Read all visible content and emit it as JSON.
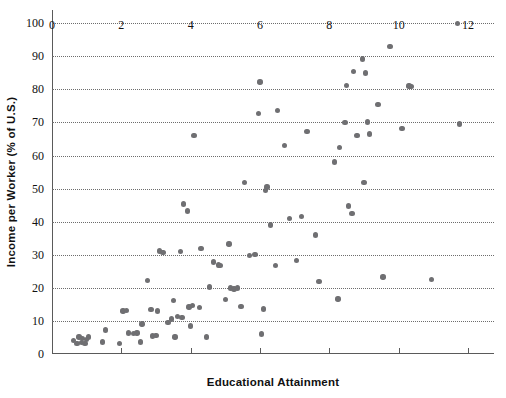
{
  "chart_data": {
    "type": "scatter",
    "title": "",
    "xlabel": "Educational Attainment",
    "ylabel": "Income per Worker (% of U.S.)",
    "xlim": [
      0,
      12.75
    ],
    "ylim": [
      0,
      104
    ],
    "xticks": [
      0,
      2,
      4,
      6,
      8,
      10,
      12
    ],
    "xtick_labels": [
      "0",
      "2",
      "4",
      "6",
      "8",
      "10",
      "12"
    ],
    "yticks": [
      0,
      10,
      20,
      30,
      40,
      50,
      60,
      70,
      80,
      90,
      100
    ],
    "ytick_labels": [
      "0",
      "10",
      "20",
      "30",
      "40",
      "50",
      "60",
      "70",
      "80",
      "90",
      "100"
    ],
    "grid": "horizontal-dotted",
    "legend": "none",
    "marker_color": "#6f6f72",
    "axis_color": "#5a5a5a",
    "points": [
      [
        0.62,
        4.0
      ],
      [
        0.72,
        3.1
      ],
      [
        0.78,
        5.2
      ],
      [
        0.85,
        3.4
      ],
      [
        0.88,
        4.6
      ],
      [
        0.95,
        3.2
      ],
      [
        1.0,
        4.4
      ],
      [
        1.05,
        5.1
      ],
      [
        1.45,
        3.6
      ],
      [
        1.55,
        7.2
      ],
      [
        1.95,
        3.1
      ],
      [
        2.05,
        13.0
      ],
      [
        2.15,
        13.1
      ],
      [
        2.2,
        6.3
      ],
      [
        2.35,
        6.2
      ],
      [
        2.45,
        6.3
      ],
      [
        2.55,
        3.6
      ],
      [
        2.6,
        9.1
      ],
      [
        2.75,
        22.3
      ],
      [
        2.85,
        13.4
      ],
      [
        2.9,
        5.4
      ],
      [
        3.0,
        5.6
      ],
      [
        3.05,
        13.0
      ],
      [
        3.1,
        31.1
      ],
      [
        3.2,
        30.7
      ],
      [
        3.35,
        9.6
      ],
      [
        3.45,
        10.6
      ],
      [
        3.5,
        16.2
      ],
      [
        3.55,
        5.1
      ],
      [
        3.62,
        11.4
      ],
      [
        3.7,
        30.9
      ],
      [
        3.75,
        11.1
      ],
      [
        3.8,
        45.4
      ],
      [
        3.9,
        43.2
      ],
      [
        3.95,
        14.2
      ],
      [
        4.0,
        8.5
      ],
      [
        4.05,
        14.6
      ],
      [
        4.1,
        66.0
      ],
      [
        4.25,
        14.0
      ],
      [
        4.3,
        31.9
      ],
      [
        4.45,
        5.1
      ],
      [
        4.55,
        20.2
      ],
      [
        4.65,
        27.8
      ],
      [
        4.8,
        26.9
      ],
      [
        4.85,
        26.8
      ],
      [
        5.0,
        16.4
      ],
      [
        5.1,
        33.2
      ],
      [
        5.15,
        20.0
      ],
      [
        5.25,
        19.7
      ],
      [
        5.35,
        20.0
      ],
      [
        5.45,
        14.3
      ],
      [
        5.55,
        51.8
      ],
      [
        5.7,
        29.8
      ],
      [
        5.85,
        30.0
      ],
      [
        5.95,
        72.8
      ],
      [
        6.0,
        82.2
      ],
      [
        6.05,
        6.0
      ],
      [
        6.1,
        13.6
      ],
      [
        6.15,
        49.5
      ],
      [
        6.2,
        50.5
      ],
      [
        6.3,
        39.0
      ],
      [
        6.45,
        26.8
      ],
      [
        6.5,
        73.6
      ],
      [
        6.7,
        63.0
      ],
      [
        6.85,
        41.0
      ],
      [
        7.05,
        28.2
      ],
      [
        7.2,
        41.6
      ],
      [
        7.35,
        67.3
      ],
      [
        7.6,
        36.0
      ],
      [
        7.7,
        22.0
      ],
      [
        8.15,
        58.0
      ],
      [
        8.25,
        16.6
      ],
      [
        8.3,
        62.5
      ],
      [
        8.45,
        70.0
      ],
      [
        8.5,
        81.1
      ],
      [
        8.55,
        44.7
      ],
      [
        8.65,
        42.4
      ],
      [
        8.7,
        85.4
      ],
      [
        8.8,
        66.0
      ],
      [
        8.95,
        89.2
      ],
      [
        9.0,
        51.9
      ],
      [
        9.05,
        85.0
      ],
      [
        9.1,
        70.2
      ],
      [
        9.15,
        66.5
      ],
      [
        9.4,
        75.5
      ],
      [
        9.55,
        23.3
      ],
      [
        9.75,
        93.0
      ],
      [
        10.1,
        68.2
      ],
      [
        10.3,
        81.0
      ],
      [
        10.35,
        80.8
      ],
      [
        10.95,
        22.6
      ],
      [
        11.7,
        100.0
      ],
      [
        11.75,
        69.5
      ]
    ]
  }
}
